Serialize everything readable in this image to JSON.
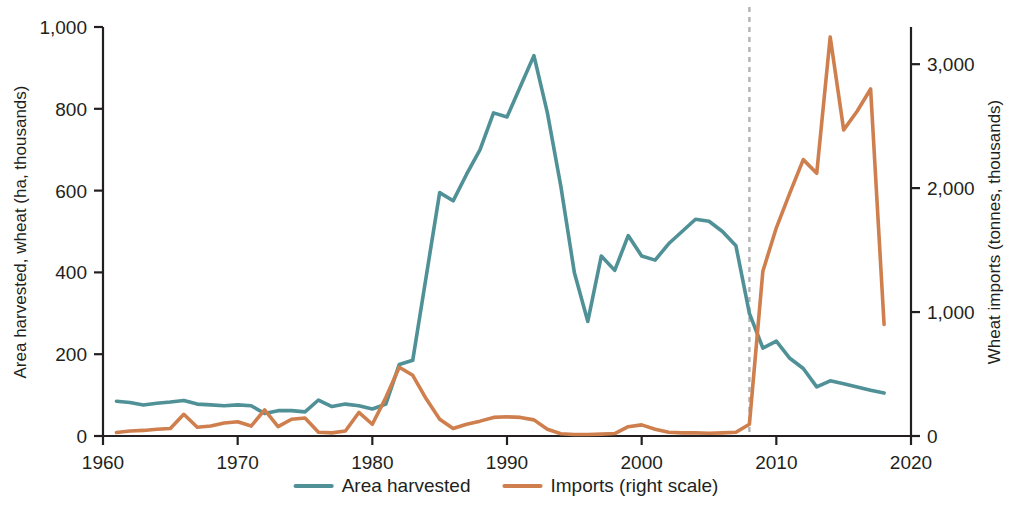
{
  "chart_data": {
    "type": "line",
    "title": "",
    "subtitle": "",
    "xlabel": "",
    "ylabel": "Area harvested, wheat (ha, thousands)",
    "y2label": "Wheat imports (tonnes, thousands)",
    "grid": false,
    "legend_position": "bottom",
    "xlim": [
      1960,
      2020
    ],
    "ylim": [
      0,
      1000
    ],
    "y2lim": [
      0,
      3300
    ],
    "xticks": [
      1960,
      1970,
      1980,
      1990,
      2000,
      2010,
      2020
    ],
    "xtick_labels": [
      "1960",
      "1970",
      "1980",
      "1990",
      "2000",
      "2010",
      "2020"
    ],
    "yticks": [
      0,
      200,
      400,
      600,
      800,
      1000
    ],
    "ytick_labels": [
      "0",
      "200",
      "400",
      "600",
      "800",
      "1,000"
    ],
    "y2ticks": [
      0,
      1000,
      2000,
      3000
    ],
    "y2tick_labels": [
      "0",
      "1,000",
      "2,000",
      "3,000"
    ],
    "annotations": [
      {
        "type": "vline",
        "x": 2008,
        "style": "dashed",
        "color": "#b3b3b3",
        "label": ""
      }
    ],
    "series": [
      {
        "name": "Area harvested",
        "axis": "left",
        "color": "#4f9196",
        "x": [
          1961,
          1962,
          1963,
          1964,
          1965,
          1966,
          1967,
          1968,
          1969,
          1970,
          1971,
          1972,
          1973,
          1974,
          1975,
          1976,
          1977,
          1978,
          1979,
          1980,
          1981,
          1982,
          1983,
          1984,
          1985,
          1986,
          1987,
          1988,
          1989,
          1990,
          1991,
          1992,
          1993,
          1994,
          1995,
          1996,
          1997,
          1998,
          1999,
          2000,
          2001,
          2002,
          2003,
          2004,
          2005,
          2006,
          2007,
          2008,
          2009,
          2010,
          2011,
          2012,
          2013,
          2014,
          2015,
          2016,
          2017,
          2018
        ],
        "values": [
          85,
          82,
          76,
          80,
          83,
          87,
          78,
          76,
          74,
          76,
          74,
          55,
          62,
          62,
          59,
          88,
          72,
          78,
          74,
          66,
          78,
          175,
          185,
          390,
          595,
          575,
          640,
          700,
          790,
          780,
          855,
          930,
          790,
          610,
          400,
          280,
          440,
          405,
          490,
          440,
          430,
          470,
          500,
          530,
          525,
          500,
          465,
          300,
          215,
          232,
          190,
          165,
          120,
          135,
          128,
          120,
          112,
          105
        ]
      },
      {
        "name": "Imports (right scale)",
        "axis": "right",
        "color": "#cf7f4e",
        "x": [
          1961,
          1962,
          1963,
          1964,
          1965,
          1966,
          1967,
          1968,
          1969,
          1970,
          1971,
          1972,
          1973,
          1974,
          1975,
          1976,
          1977,
          1978,
          1979,
          1980,
          1981,
          1982,
          1983,
          1984,
          1985,
          1986,
          1987,
          1988,
          1989,
          1990,
          1991,
          1992,
          1993,
          1994,
          1995,
          1996,
          1997,
          1998,
          1999,
          2000,
          2001,
          2002,
          2003,
          2004,
          2005,
          2006,
          2007,
          2008,
          2009,
          2010,
          2011,
          2012,
          2013,
          2014,
          2015,
          2016,
          2017,
          2018
        ],
        "values": [
          28,
          40,
          45,
          55,
          60,
          175,
          70,
          80,
          105,
          115,
          80,
          210,
          75,
          135,
          145,
          30,
          25,
          40,
          190,
          95,
          310,
          555,
          490,
          300,
          135,
          60,
          95,
          120,
          150,
          155,
          150,
          130,
          55,
          18,
          12,
          12,
          15,
          20,
          75,
          90,
          55,
          30,
          25,
          25,
          22,
          25,
          30,
          95,
          1330,
          1680,
          1960,
          2230,
          2120,
          3220,
          2470,
          2620,
          2800,
          900
        ]
      }
    ],
    "legend": [
      {
        "label": "Area harvested",
        "color": "#4f9196"
      },
      {
        "label": "Imports (right scale)",
        "color": "#cf7f4e"
      }
    ]
  }
}
